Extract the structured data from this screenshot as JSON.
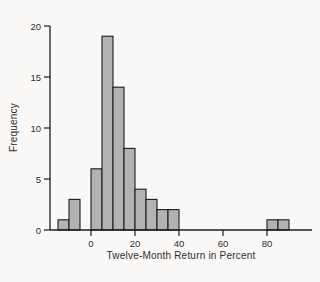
{
  "figure": {
    "background": "#f9f8f6",
    "bar_fill": "#b3b2b0",
    "bar_stroke": "#1c1c1c",
    "axis_color": "#1c1c1c",
    "text_color": "#2e2e2e"
  },
  "chart_data": {
    "type": "bar",
    "subtype": "histogram",
    "title": "",
    "xlabel": "Twelve-Month Return in Percent",
    "ylabel": "Frequency",
    "xlim": [
      -20,
      98
    ],
    "ylim": [
      0,
      20
    ],
    "x_ticks": [
      0,
      20,
      40,
      60,
      80
    ],
    "y_ticks": [
      0,
      5,
      10,
      15,
      20
    ],
    "grid": false,
    "legend_position": "none",
    "bin_width": 5,
    "bins": [
      {
        "start": -15,
        "end": -10,
        "frequency": 1
      },
      {
        "start": -10,
        "end": -5,
        "frequency": 3
      },
      {
        "start": -5,
        "end": 0,
        "frequency": 0
      },
      {
        "start": 0,
        "end": 5,
        "frequency": 6
      },
      {
        "start": 5,
        "end": 10,
        "frequency": 19
      },
      {
        "start": 10,
        "end": 15,
        "frequency": 14
      },
      {
        "start": 15,
        "end": 20,
        "frequency": 8
      },
      {
        "start": 20,
        "end": 25,
        "frequency": 4
      },
      {
        "start": 25,
        "end": 30,
        "frequency": 3
      },
      {
        "start": 30,
        "end": 35,
        "frequency": 2
      },
      {
        "start": 35,
        "end": 40,
        "frequency": 2
      },
      {
        "start": 80,
        "end": 85,
        "frequency": 1
      },
      {
        "start": 85,
        "end": 90,
        "frequency": 1
      }
    ]
  }
}
